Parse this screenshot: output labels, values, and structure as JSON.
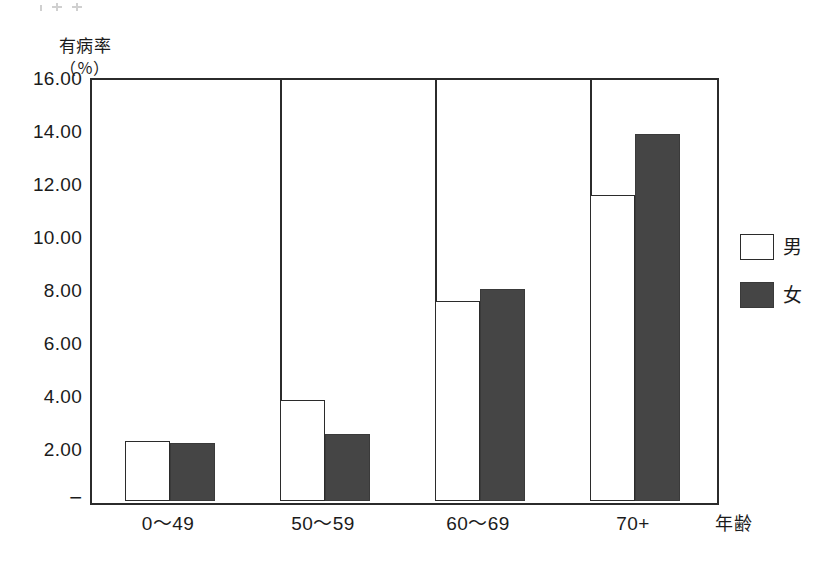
{
  "chart_data": {
    "type": "bar",
    "title": "",
    "subtitle": "",
    "ylabel": "有病率",
    "yunit": "（％）",
    "xlabel": "年齢",
    "categories": [
      "0〜49",
      "50〜59",
      "60〜69",
      "70+"
    ],
    "series": [
      {
        "name": "男",
        "color": "#ffffff",
        "values": [
          2.3,
          3.85,
          7.6,
          11.65
        ]
      },
      {
        "name": "女",
        "color": "#454545",
        "values": [
          2.2,
          2.55,
          8.05,
          13.95
        ]
      }
    ],
    "ylim": [
      0,
      16
    ],
    "ytick_labels": [
      "16.00",
      "14.00",
      "12.00",
      "10.00",
      "8.00",
      "6.00",
      "4.00",
      "2.00",
      "−"
    ],
    "ytick_values": [
      16,
      14,
      12,
      10,
      8,
      6,
      4,
      2,
      0
    ],
    "grid": false,
    "legend_position": "right",
    "axis_color": "#2b2b2b",
    "background": "#ffffff"
  },
  "legend": {
    "entries": [
      {
        "label": "男",
        "swatch": "male"
      },
      {
        "label": "女",
        "swatch": "female"
      }
    ]
  },
  "axis": {
    "y_title_line1": "有病率",
    "y_title_line2": "（％）",
    "x_title": "年齢"
  }
}
